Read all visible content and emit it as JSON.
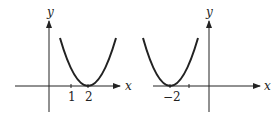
{
  "figures": [
    {
      "name": "left-graph",
      "x_axis_label": "x",
      "y_axis_label": "y",
      "tick_labels": [
        "1",
        "2"
      ],
      "vertex_x": 2
    },
    {
      "name": "right-graph",
      "x_axis_label": "x",
      "y_axis_label": "y",
      "tick_labels": [
        "−2"
      ],
      "vertex_x": -2
    }
  ],
  "colors": {
    "stroke": "#222222",
    "background": "#ffffff"
  }
}
